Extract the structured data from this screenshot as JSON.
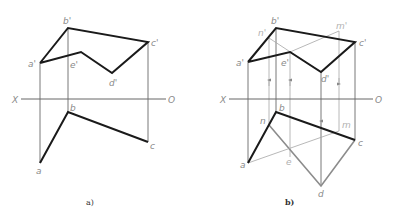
{
  "figure": {
    "panels": [
      {
        "caption": "a)",
        "axis": {
          "left_label": "X",
          "right_label": "O"
        },
        "front_view_labels": {
          "a": "a'",
          "b": "b'",
          "c": "c'",
          "d": "d'",
          "e": "e'"
        },
        "top_view_labels": {
          "a": "a",
          "b": "b",
          "c": "c"
        }
      },
      {
        "caption": "b)",
        "axis": {
          "left_label": "X",
          "right_label": "O"
        },
        "front_view_labels": {
          "a": "a'",
          "b": "b'",
          "c": "c'",
          "d": "d'",
          "e": "e'",
          "n": "n'",
          "m": "m'"
        },
        "top_view_labels": {
          "a": "a",
          "b": "b",
          "c": "c",
          "d": "d",
          "e": "e",
          "n": "n",
          "m": "m"
        }
      }
    ],
    "colors": {
      "thick": "#1a1a1a",
      "construction": "#8c8c8c",
      "label": "#8a8a8a"
    }
  }
}
